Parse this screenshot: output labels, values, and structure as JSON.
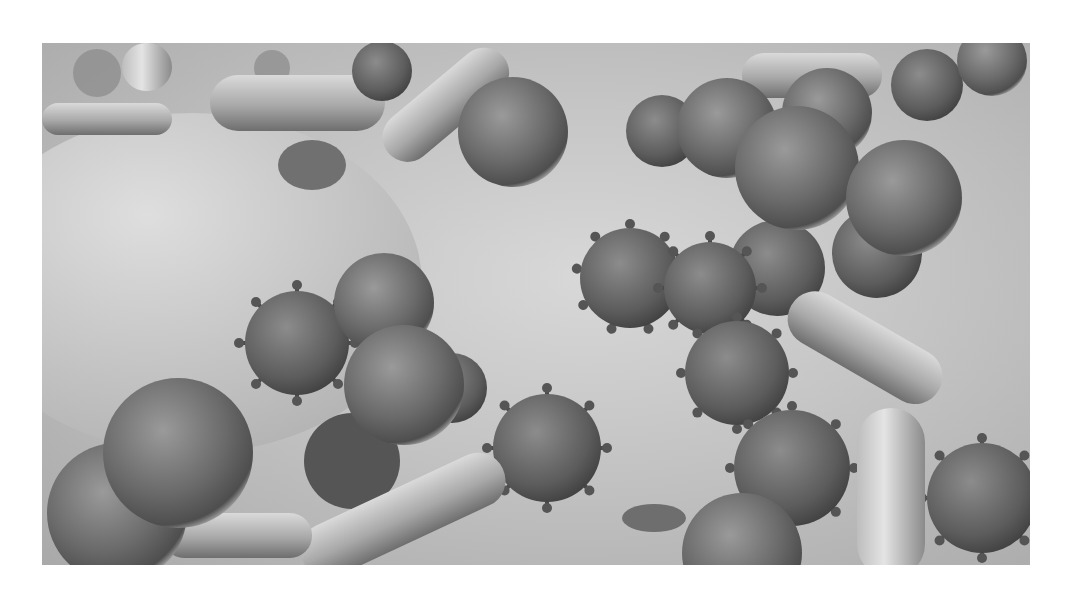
{
  "image": {
    "alt": "Grayscale 3D render of microorganisms — spiky virus particles, spherical cocci and rod-shaped bacilli resting on a textured surface",
    "palette": {
      "background": "#ffffff",
      "surface_light": "#d8d8d8",
      "surface_mid": "#c4c4c4",
      "surface_dark": "#a9a9a9",
      "sphere_dark": "#5a5a5a",
      "sphere_light": "#9a9a9a",
      "rod_light": "#cfcfcf",
      "rod_dark": "#7e7e7e"
    }
  }
}
